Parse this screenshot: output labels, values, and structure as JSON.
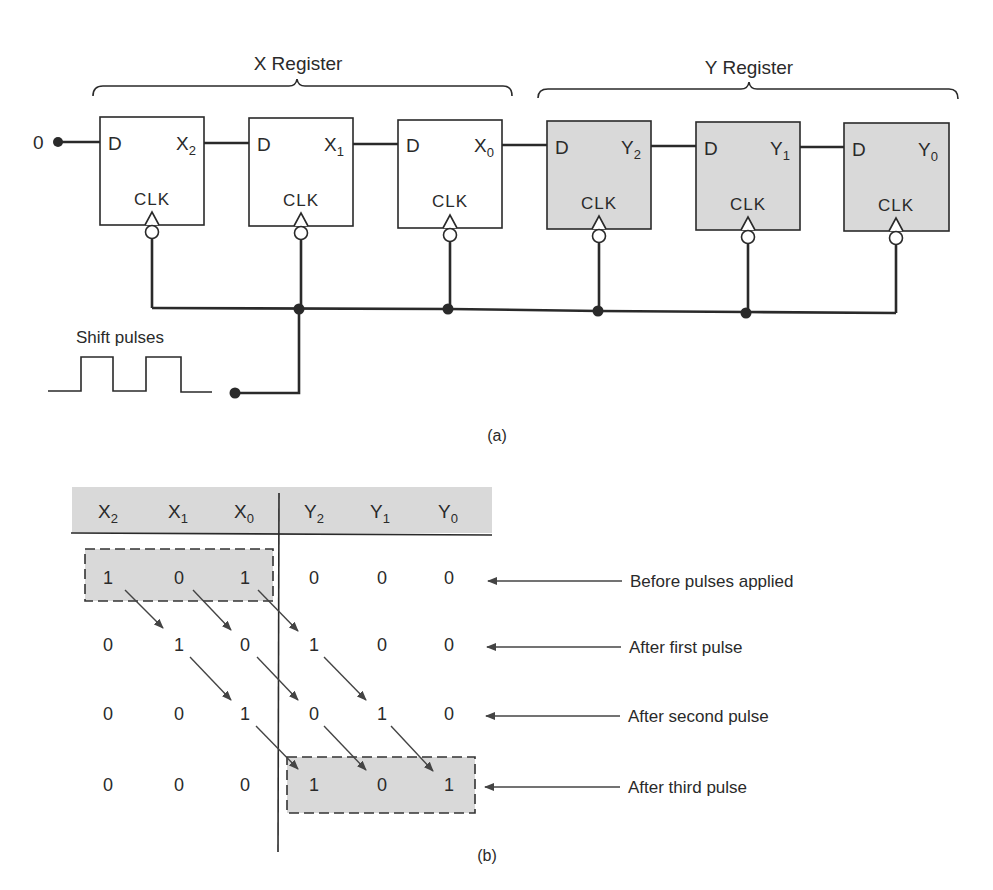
{
  "part_a": {
    "caption": "(a)",
    "x_register": {
      "title": "X Register",
      "fill": "#ffffff",
      "flipflops": [
        {
          "input": "D",
          "output": "X",
          "output_sub": "2",
          "clock": "CLK"
        },
        {
          "input": "D",
          "output": "X",
          "output_sub": "1",
          "clock": "CLK"
        },
        {
          "input": "D",
          "output": "X",
          "output_sub": "0",
          "clock": "CLK"
        }
      ]
    },
    "y_register": {
      "title": "Y Register",
      "fill": "#d9d9d9",
      "flipflops": [
        {
          "input": "D",
          "output": "Y",
          "output_sub": "2",
          "clock": "CLK"
        },
        {
          "input": "D",
          "output": "Y",
          "output_sub": "1",
          "clock": "CLK"
        },
        {
          "input": "D",
          "output": "Y",
          "output_sub": "0",
          "clock": "CLK"
        }
      ]
    },
    "serial_input_value": "0",
    "clock_source_label": "Shift pulses"
  },
  "part_b": {
    "caption": "(b)",
    "header_fill": "#d9d9d9",
    "highlight_fill": "#d9d9d9",
    "columns": [
      {
        "name": "X",
        "sub": "2"
      },
      {
        "name": "X",
        "sub": "1"
      },
      {
        "name": "X",
        "sub": "0"
      },
      {
        "name": "Y",
        "sub": "2"
      },
      {
        "name": "Y",
        "sub": "1"
      },
      {
        "name": "Y",
        "sub": "0"
      }
    ],
    "rows": [
      {
        "values": [
          "1",
          "0",
          "1",
          "0",
          "0",
          "0"
        ],
        "label": "Before pulses applied"
      },
      {
        "values": [
          "0",
          "1",
          "0",
          "1",
          "0",
          "0"
        ],
        "label": "After first pulse"
      },
      {
        "values": [
          "0",
          "0",
          "1",
          "0",
          "1",
          "0"
        ],
        "label": "After second pulse"
      },
      {
        "values": [
          "0",
          "0",
          "0",
          "1",
          "0",
          "1"
        ],
        "label": "After third pulse"
      }
    ]
  }
}
